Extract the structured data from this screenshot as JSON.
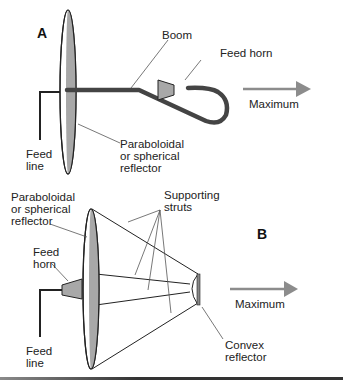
{
  "figure": {
    "panel_a": {
      "label": "A",
      "labels": {
        "boom": "Boom",
        "feed_horn": "Feed horn",
        "maximum": "Maximum",
        "feed_line": "Feed\nline",
        "reflector": "Paraboloidal\nor spherical\nreflector"
      }
    },
    "panel_b": {
      "label": "B",
      "labels": {
        "reflector": "Paraboloidal\nor spherical\nreflector",
        "supporting_struts": "Supporting\nstruts",
        "feed_horn": "Feed\nhorn",
        "maximum": "Maximum",
        "convex_reflector": "Convex\nreflector",
        "feed_line": "Feed\nline"
      }
    },
    "colors": {
      "dish_fill": "#a8a8a8",
      "boom": "#444444",
      "arrow": "#8c8c8c",
      "line": "#222222"
    }
  }
}
